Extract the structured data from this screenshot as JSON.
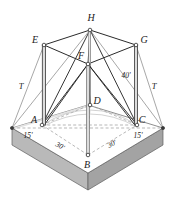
{
  "figure": {
    "type": "engineering-line-diagram",
    "canvas": {
      "width": 174,
      "height": 200
    },
    "colors": {
      "line": "#2b2b2b",
      "thin_line": "#8a8a8a",
      "dashed_line": "#9a9a9a",
      "slab_top": "#ffffff",
      "slab_front_left": "#b5b5b5",
      "slab_front_right": "#a6a6a6",
      "slab_edge": "#6f6f6f",
      "post_fill": "#d9d9d9",
      "node_fill": "#ffffff",
      "label": "#1a1a1a",
      "background": "#ffffff"
    }
  },
  "points": [
    {
      "id": "H",
      "label": "H",
      "x": 90,
      "y": 30,
      "label_x": 91,
      "label_y": 21,
      "node": true
    },
    {
      "id": "E",
      "label": "E",
      "x": 44,
      "y": 45,
      "label_x": 35,
      "label_y": 43,
      "node": true
    },
    {
      "id": "G",
      "label": "G",
      "x": 136,
      "y": 45,
      "label_x": 142,
      "label_y": 43,
      "node": true
    },
    {
      "id": "F",
      "label": "F",
      "x": 88,
      "y": 64,
      "label_x": 81,
      "label_y": 58,
      "node": true
    },
    {
      "id": "D",
      "label": "D",
      "x": 90,
      "y": 105,
      "label_x": 96,
      "label_y": 103,
      "node": true
    },
    {
      "id": "A",
      "label": "A",
      "x": 42,
      "y": 125,
      "label_x": 34,
      "label_y": 122,
      "node": true
    },
    {
      "id": "C",
      "label": "C",
      "x": 137,
      "y": 125,
      "label_x": 140,
      "label_y": 122,
      "node": true
    },
    {
      "id": "B",
      "label": "B",
      "x": 88,
      "y": 155,
      "label_x": 87,
      "label_y": 167,
      "node": true
    }
  ],
  "dimensions": [
    {
      "id": "height-40",
      "label": "40'",
      "x": 126,
      "y": 76,
      "rotate": 0
    },
    {
      "id": "left-15",
      "label": "15'",
      "x": 27,
      "y": 136,
      "rotate": 0
    },
    {
      "id": "right-15",
      "label": "15'",
      "x": 137,
      "y": 136,
      "rotate": 0
    },
    {
      "id": "left-30",
      "label": "30'",
      "x": 59,
      "y": 147,
      "rotate": 28
    },
    {
      "id": "right-30",
      "label": "30'",
      "x": 113,
      "y": 145,
      "rotate": -28
    }
  ],
  "guy_labels": [
    {
      "id": "guy-left",
      "label": "T",
      "x": 21,
      "y": 87
    },
    {
      "id": "guy-right",
      "label": "T",
      "x": 153,
      "y": 87
    }
  ],
  "anchors": [
    {
      "id": "anchor-left",
      "x": 12,
      "y": 128
    },
    {
      "id": "anchor-right",
      "x": 163,
      "y": 128
    }
  ],
  "slab": {
    "top_left": {
      "x": 12,
      "y": 128
    },
    "top_back": {
      "x": 88,
      "y": 105
    },
    "top_right": {
      "x": 163,
      "y": 128
    },
    "top_front": {
      "x": 88,
      "y": 173
    },
    "thickness": 17
  }
}
